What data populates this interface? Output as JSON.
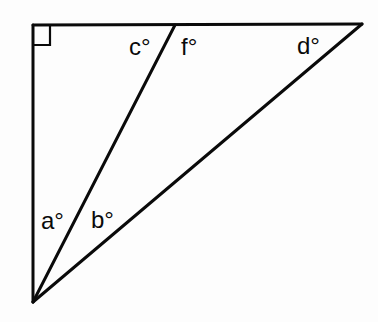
{
  "diagram": {
    "colors": {
      "line": "#0a0a0a",
      "background": "#fdfdfd"
    },
    "vertices": {
      "top_left": {
        "x": 33,
        "y": 25
      },
      "top_right": {
        "x": 362,
        "y": 24
      },
      "bottom": {
        "x": 33,
        "y": 302
      },
      "top_mid": {
        "x": 175,
        "y": 25
      }
    },
    "right_angle_marker": {
      "x": 33,
      "y": 25,
      "size": 17
    },
    "labels": {
      "a": "a°",
      "b": "b°",
      "c": "c°",
      "d": "d°",
      "f": "f°"
    }
  }
}
